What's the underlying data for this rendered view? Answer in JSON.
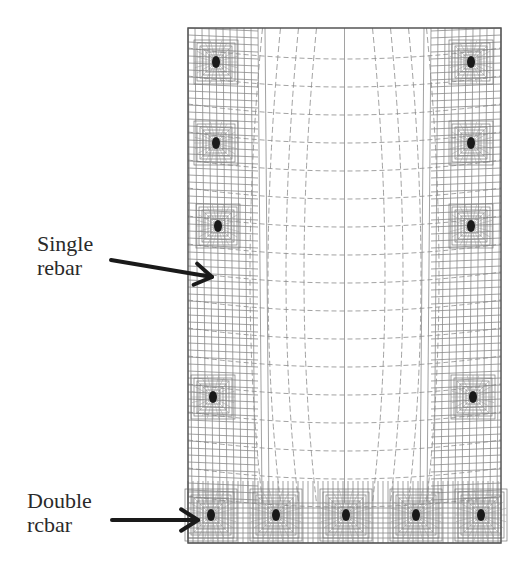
{
  "figure": {
    "colors": {
      "mesh_line": "#8a8a8a",
      "boundary": "#555555",
      "rebar_core": "#1a1a1a",
      "arrow": "#1a1a1a",
      "background": "#ffffff"
    }
  },
  "annotations": {
    "single": {
      "line1": "Single",
      "line2": "rebar"
    },
    "double": {
      "line1": "Double",
      "line2": "rcbar"
    }
  },
  "mesh": {
    "bounds": {
      "x": 188,
      "y": 28,
      "width": 313,
      "height": 515
    },
    "single_rebars": [
      {
        "x": 216,
        "y": 62
      },
      {
        "x": 471,
        "y": 62
      },
      {
        "x": 216,
        "y": 143
      },
      {
        "x": 471,
        "y": 143
      },
      {
        "x": 218,
        "y": 226
      },
      {
        "x": 471,
        "y": 226
      },
      {
        "x": 213,
        "y": 397
      },
      {
        "x": 473,
        "y": 397
      }
    ],
    "double_rebars": [
      {
        "x": 211,
        "y": 515
      },
      {
        "x": 276,
        "y": 515
      },
      {
        "x": 346,
        "y": 515
      },
      {
        "x": 416,
        "y": 515
      },
      {
        "x": 481,
        "y": 515
      }
    ]
  }
}
